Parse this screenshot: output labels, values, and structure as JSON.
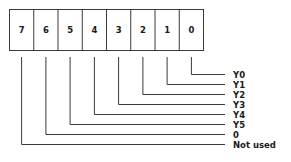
{
  "register": {
    "bits": [
      "7",
      "6",
      "5",
      "4",
      "3",
      "2",
      "1",
      "0"
    ]
  },
  "labels": [
    {
      "bit": "0",
      "text": "Y0"
    },
    {
      "bit": "1",
      "text": "Y1"
    },
    {
      "bit": "2",
      "text": "Y2"
    },
    {
      "bit": "3",
      "text": "Y3"
    },
    {
      "bit": "4",
      "text": "Y4"
    },
    {
      "bit": "5",
      "text": "Y5"
    },
    {
      "bit": "6",
      "text": "0"
    },
    {
      "bit": "7",
      "text": "Not used"
    }
  ],
  "colors": {
    "line": "#3a3a3a",
    "text": "#1a1a1a",
    "background": "#ffffff"
  }
}
